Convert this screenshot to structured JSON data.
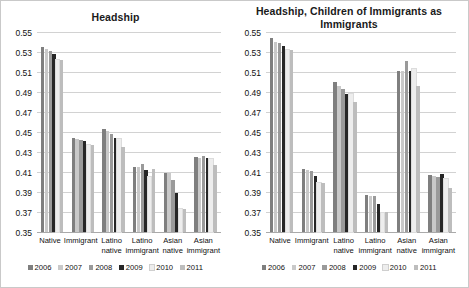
{
  "figure": {
    "background": "#ffffff",
    "border_color": "#c9c9c9"
  },
  "series_colors": [
    "#7f7f7f",
    "#c9c9c9",
    "#9a9a9a",
    "#262626",
    "#ededed",
    "#bdbdbd"
  ],
  "legend": {
    "entries": [
      {
        "label": "2006",
        "color": "#7f7f7f"
      },
      {
        "label": "2007",
        "color": "#c9c9c9"
      },
      {
        "label": "2008",
        "color": "#9a9a9a"
      },
      {
        "label": "2009",
        "color": "#262626"
      },
      {
        "label": "2010",
        "color": "#ededed"
      },
      {
        "label": "2011",
        "color": "#bdbdbd"
      }
    ]
  },
  "axis": {
    "ticks": [
      "0.55",
      "0.53",
      "0.51",
      "0.49",
      "0.47",
      "0.45",
      "0.43",
      "0.41",
      "0.39",
      "0.37",
      "0.35"
    ],
    "min": 0.35,
    "max": 0.55,
    "step": 0.02
  },
  "categories": [
    "Native",
    "Immigrant",
    "Latino native",
    "Latino immigrant",
    "Asian native",
    "Asian immigrant"
  ],
  "chart_data": [
    {
      "type": "bar",
      "title": "Headship",
      "xlabel": "",
      "ylabel": "",
      "ylim": [
        0.35,
        0.55
      ],
      "ytick_step": 0.02,
      "grid": true,
      "legend_position": "bottom",
      "categories": [
        "Native",
        "Immigrant",
        "Latino native",
        "Latino immigrant",
        "Asian native",
        "Asian immigrant"
      ],
      "series": [
        {
          "name": "2006",
          "values": [
            0.5355,
            0.444,
            0.4535,
            0.4155,
            0.409,
            0.4255
          ]
        },
        {
          "name": "2007",
          "values": [
            0.533,
            0.4435,
            0.451,
            0.4155,
            0.4095,
            0.4245
          ]
        },
        {
          "name": "2008",
          "values": [
            0.531,
            0.4425,
            0.448,
            0.4185,
            0.4025,
            0.4265
          ]
        },
        {
          "name": "2009",
          "values": [
            0.5285,
            0.441,
            0.4445,
            0.4125,
            0.389,
            0.424
          ]
        },
        {
          "name": "2010",
          "values": [
            0.522,
            0.437,
            0.4435,
            0.405,
            0.373,
            0.423
          ]
        },
        {
          "name": "2011",
          "values": [
            0.522,
            0.437,
            0.4355,
            0.4135,
            0.373,
            0.417
          ]
        }
      ]
    },
    {
      "type": "bar",
      "title": "Headship, Children of Immigrants as Immigrants",
      "xlabel": "",
      "ylabel": "",
      "ylim": [
        0.35,
        0.55
      ],
      "ytick_step": 0.02,
      "grid": true,
      "legend_position": "bottom",
      "categories": [
        "Native",
        "Immigrant",
        "Latino native",
        "Latino immigrant",
        "Asian native",
        "Asian immigrant"
      ],
      "series": [
        {
          "name": "2006",
          "values": [
            0.544,
            0.4135,
            0.5005,
            0.387,
            0.511,
            0.407
          ]
        },
        {
          "name": "2007",
          "values": [
            0.5405,
            0.412,
            0.496,
            0.3865,
            0.511,
            0.4065
          ]
        },
        {
          "name": "2008",
          "values": [
            0.539,
            0.411,
            0.493,
            0.3865,
            0.5215,
            0.405
          ]
        },
        {
          "name": "2009",
          "values": [
            0.5365,
            0.406,
            0.4885,
            0.378,
            0.5115,
            0.4085
          ]
        },
        {
          "name": "2010",
          "values": [
            0.532,
            0.3995,
            0.488,
            0.369,
            0.513,
            0.403
          ]
        },
        {
          "name": "2011",
          "values": [
            0.532,
            0.3995,
            0.4805,
            0.37,
            0.4965,
            0.394
          ]
        }
      ]
    }
  ]
}
